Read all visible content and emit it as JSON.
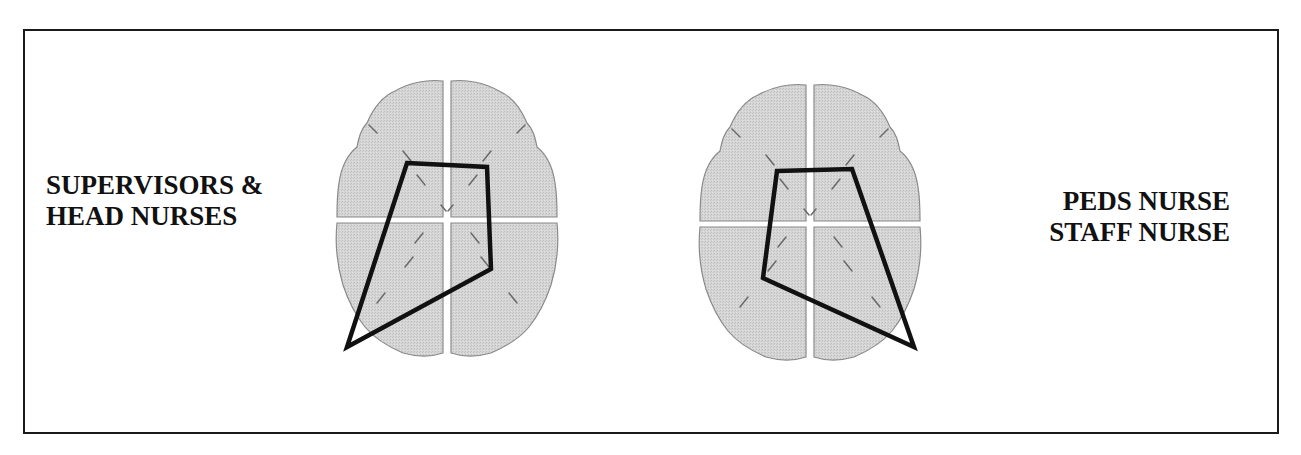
{
  "figure": {
    "type": "brain-topography-comparison",
    "colors": {
      "frame": "#1a1a1a",
      "brain_fill": "#d4d4d4",
      "brain_outline": "#8a8a8a",
      "polygon_stroke": "#111111",
      "text": "#111111"
    },
    "panels": [
      {
        "id": "left",
        "label_lines": [
          "SUPERVISORS &",
          "HEAD NURSES"
        ],
        "brain_center": [
          447,
          213
        ],
        "polygon_points": [
          [
            407,
            163
          ],
          [
            487,
            167
          ],
          [
            491,
            269
          ],
          [
            347,
            347
          ]
        ]
      },
      {
        "id": "right",
        "label_lines": [
          "PEDS NURSE",
          "STAFF NURSE"
        ],
        "brain_center": [
          810,
          217
        ],
        "polygon_points": [
          [
            777,
            171
          ],
          [
            852,
            169
          ],
          [
            914,
            347
          ],
          [
            763,
            278
          ]
        ]
      }
    ]
  },
  "left_label": {
    "line1": "SUPERVISORS &",
    "line2": "HEAD NURSES"
  },
  "right_label": {
    "line1": "PEDS NURSE",
    "line2": "STAFF NURSE"
  }
}
